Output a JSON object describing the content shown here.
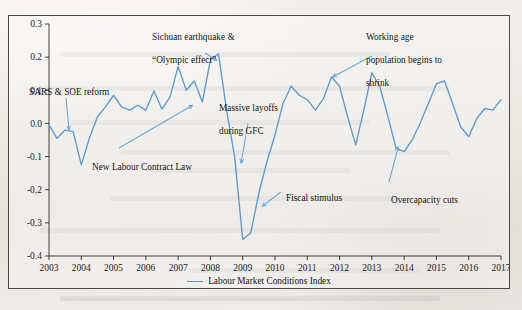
{
  "chart_data": {
    "type": "line",
    "title": "",
    "xlabel": "",
    "ylabel": "",
    "xlim": [
      2003,
      2017
    ],
    "ylim": [
      -0.4,
      0.3
    ],
    "ytick_labels": [
      "0.3",
      "0.2",
      "0.1",
      "0.0",
      "-0.1",
      "-0.2",
      "-0.3",
      "-0.4"
    ],
    "ytick_values": [
      0.3,
      0.2,
      0.1,
      0.0,
      -0.1,
      -0.2,
      -0.3,
      -0.4
    ],
    "xtick_labels": [
      "2003",
      "2004",
      "2005",
      "2006",
      "2007",
      "2008",
      "2009",
      "2010",
      "2011",
      "2012",
      "2013",
      "2014",
      "2015",
      "2016",
      "2017"
    ],
    "xtick_values": [
      2003,
      2004,
      2005,
      2006,
      2007,
      2008,
      2009,
      2010,
      2011,
      2012,
      2013,
      2014,
      2015,
      2016,
      2017
    ],
    "grid": false,
    "legend_position": "bottom-center",
    "series": [
      {
        "name": "Labour Market Conditions Index",
        "color": "#5b9bd5",
        "x": [
          2003.0,
          2003.25,
          2003.5,
          2003.75,
          2004.0,
          2004.25,
          2004.5,
          2004.75,
          2005.0,
          2005.25,
          2005.5,
          2005.75,
          2006.0,
          2006.25,
          2006.5,
          2006.75,
          2007.0,
          2007.25,
          2007.5,
          2007.75,
          2008.0,
          2008.25,
          2008.5,
          2008.75,
          2009.0,
          2009.25,
          2009.5,
          2009.75,
          2010.0,
          2010.25,
          2010.5,
          2010.75,
          2011.0,
          2011.25,
          2011.5,
          2011.75,
          2012.0,
          2012.25,
          2012.5,
          2012.75,
          2013.0,
          2013.25,
          2013.5,
          2013.75,
          2014.0,
          2014.25,
          2014.5,
          2014.75,
          2015.0,
          2015.25,
          2015.5,
          2015.75,
          2016.0,
          2016.25,
          2016.5,
          2016.75,
          2017.0
        ],
        "values": [
          -0.005,
          -0.045,
          -0.02,
          -0.025,
          -0.125,
          -0.045,
          0.02,
          0.05,
          0.085,
          0.05,
          0.04,
          0.055,
          0.04,
          0.098,
          0.043,
          0.08,
          0.172,
          0.1,
          0.128,
          0.065,
          0.192,
          0.21,
          0.04,
          -0.1,
          -0.35,
          -0.33,
          -0.21,
          -0.115,
          -0.035,
          0.06,
          0.113,
          0.085,
          0.072,
          0.04,
          0.075,
          0.14,
          0.112,
          0.02,
          -0.065,
          0.04,
          0.153,
          0.11,
          0.02,
          -0.075,
          -0.085,
          -0.05,
          0.002,
          0.06,
          0.12,
          0.128,
          0.06,
          -0.01,
          -0.04,
          0.015,
          0.045,
          0.04,
          0.072
        ]
      }
    ],
    "annotations": [
      {
        "id": "sars",
        "text": "SARS & SOE reform",
        "target_year": 2003.62,
        "target_value": -0.02
      },
      {
        "id": "sichuan",
        "text": "Sichuan earthquake &\n“Olympic effect”",
        "target_year": 2008.2,
        "target_value": 0.19
      },
      {
        "id": "labour-law",
        "text": "New Labour Contract Law",
        "target_year": 2007.45,
        "target_value": 0.055
      },
      {
        "id": "layoffs",
        "text": "Massive layoffs\nduring GFC",
        "target_year": 2008.95,
        "target_value": -0.12
      },
      {
        "id": "fiscal",
        "text": "Fiscal stimulus",
        "target_year": 2009.6,
        "target_value": -0.25
      },
      {
        "id": "working-age",
        "text": "Working age\npopulation begins to\nshrink",
        "target_year": 2011.78,
        "target_value": 0.14
      },
      {
        "id": "overcapacity",
        "text": "Overcapacity cuts",
        "target_year": 2013.82,
        "target_value": -0.07
      }
    ]
  },
  "legend": {
    "label": "Labour Market Conditions Index"
  },
  "annotation_text": {
    "sars": "SARS & SOE reform",
    "sichuan_line1": "Sichuan earthquake &",
    "sichuan_line2": "“Olympic effect”",
    "labour_law": "New Labour Contract Law",
    "layoffs_line1": "Massive layoffs",
    "layoffs_line2": "during GFC",
    "fiscal": "Fiscal stimulus",
    "working_line1": "Working age",
    "working_line2": "population begins to",
    "working_line3": "shrink",
    "overcapacity": "Overcapacity cuts"
  }
}
